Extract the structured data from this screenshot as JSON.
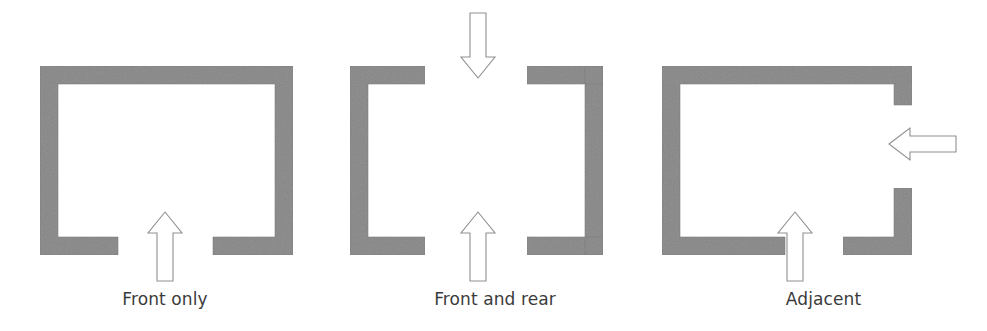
{
  "figure": {
    "background_color": "#ffffff",
    "wall_fill_color": "#878787",
    "wall_edge_color": "#6f6f6f",
    "arrow_fill_color": "#ffffff",
    "arrow_stroke_color": "#8a8a8a",
    "caption_color": "#3b3b3b"
  },
  "panels": [
    {
      "id": "front-only",
      "caption": "Front only",
      "walls_name": "u-shaped-enclosure-open-front",
      "arrows": [
        {
          "name": "arrow-up-front",
          "direction": "up",
          "label": "front access"
        }
      ]
    },
    {
      "id": "front-and-rear",
      "caption": "Front and rear",
      "walls_name": "two-facing-brackets-open-front-and-rear",
      "arrows": [
        {
          "name": "arrow-down-rear",
          "direction": "down",
          "label": "rear access"
        },
        {
          "name": "arrow-up-front",
          "direction": "up",
          "label": "front access"
        }
      ]
    },
    {
      "id": "adjacent",
      "caption": "Adjacent",
      "walls_name": "enclosure-open-front-and-right-side",
      "arrows": [
        {
          "name": "arrow-left-side",
          "direction": "left",
          "label": "side access"
        },
        {
          "name": "arrow-up-front",
          "direction": "up",
          "label": "front access"
        }
      ]
    }
  ]
}
